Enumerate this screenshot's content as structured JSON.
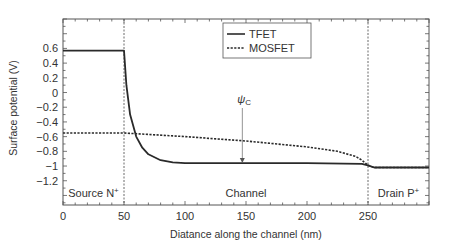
{
  "chart_data": {
    "type": "line",
    "title": "",
    "xlabel": "Diatance along the channel (nm)",
    "ylabel": "Surface potential (V)",
    "xlim": [
      0,
      300
    ],
    "ylim": [
      -1.53,
      1.0
    ],
    "x_ticks": [
      0,
      50,
      100,
      150,
      200,
      250
    ],
    "y_ticks": [
      0.6,
      0.4,
      0.2,
      0,
      -0.2,
      -0.4,
      -0.6,
      -0.8,
      -1,
      -1.2
    ],
    "x_tick_labels": [
      "0",
      "50",
      "100",
      "150",
      "200",
      "250"
    ],
    "y_tick_labels": [
      "0.6",
      "0.4",
      "0.2",
      "0",
      "−0.2",
      "−0.4",
      "−0.6",
      "−0.8",
      "−1",
      "−1.2"
    ],
    "grid": false,
    "legend_position": "upper-center-left",
    "series": [
      {
        "name": "TFET",
        "style": "solid",
        "x": [
          0,
          50,
          52,
          55,
          60,
          65,
          70,
          80,
          90,
          100,
          150,
          200,
          245,
          250,
          255,
          300
        ],
        "values": [
          0.57,
          0.57,
          0.1,
          -0.3,
          -0.6,
          -0.75,
          -0.84,
          -0.92,
          -0.95,
          -0.96,
          -0.96,
          -0.96,
          -0.97,
          -0.99,
          -1.02,
          -1.02
        ]
      },
      {
        "name": "MOSFET",
        "style": "dashed",
        "x": [
          0,
          50,
          100,
          150,
          200,
          225,
          240,
          245,
          250,
          255,
          300
        ],
        "values": [
          -0.55,
          -0.55,
          -0.6,
          -0.66,
          -0.74,
          -0.8,
          -0.87,
          -0.92,
          -0.99,
          -1.02,
          -1.02
        ]
      }
    ],
    "annotations": [
      {
        "text": "ψC",
        "x": 147,
        "y": -0.96,
        "type": "arrow"
      },
      {
        "text": "Source N⁺",
        "region": [
          0,
          50
        ]
      },
      {
        "text": "Channel",
        "region": [
          50,
          250
        ]
      },
      {
        "text": "Drain P⁺",
        "region": [
          250,
          300
        ]
      }
    ],
    "vertical_lines": [
      50,
      250
    ]
  },
  "legend": {
    "items": [
      {
        "label": "TFET",
        "style": "solid"
      },
      {
        "label": "MOSFET",
        "style": "dashed"
      }
    ]
  },
  "labels": {
    "psi": "ψ",
    "psi_sub": "C",
    "source": "Source N",
    "drain": "Drain P",
    "channel": "Channel",
    "plus": "+"
  }
}
